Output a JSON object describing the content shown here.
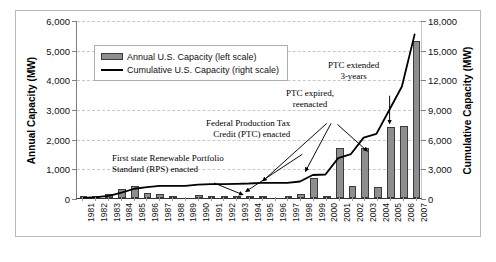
{
  "chart_data": {
    "type": "bar",
    "title": "",
    "xlabel": "",
    "ylabel": "Annual Capacity (MW)",
    "y2label": "Cumulative Capacity (MW)",
    "ylim": [
      0,
      6000
    ],
    "y2lim": [
      0,
      18000
    ],
    "grid": true,
    "legend_position": "upper-left-inside",
    "categories": [
      "1981",
      "1982",
      "1983",
      "1984",
      "1985",
      "1986",
      "1987",
      "1988",
      "1989",
      "1990",
      "1991",
      "1992",
      "1993",
      "1994",
      "1995",
      "1996",
      "1997",
      "1998",
      "1999",
      "2000",
      "2001",
      "2002",
      "2003",
      "2004",
      "2005",
      "2006",
      "2007"
    ],
    "yticks": [
      "0",
      "1,000",
      "2,000",
      "3,000",
      "4,000",
      "5,000",
      "6,000"
    ],
    "y2ticks": [
      "0",
      "3,000",
      "6,000",
      "9,000",
      "12,000",
      "15,000",
      "18,000"
    ],
    "series": [
      {
        "name": "Annual U.S. Capacity (left scale)",
        "type": "bar",
        "axis": "left",
        "unit": "MW",
        "color": "#8e8e8e",
        "values": [
          10,
          80,
          130,
          320,
          400,
          170,
          120,
          10,
          0,
          110,
          60,
          5,
          30,
          30,
          60,
          0,
          5,
          140,
          660,
          50,
          1670,
          410,
          1670,
          380,
          2400,
          2420,
          5300
        ]
      },
      {
        "name": "Cumulative U.S. Capacity (right scale)",
        "type": "line",
        "axis": "right",
        "unit": "MW",
        "color": "#000000",
        "values": [
          10,
          90,
          220,
          540,
          940,
          1110,
          1230,
          1240,
          1240,
          1350,
          1410,
          1415,
          1445,
          1475,
          1535,
          1535,
          1540,
          1680,
          2340,
          2390,
          4060,
          4470,
          6140,
          6520,
          8920,
          11340,
          16640
        ]
      }
    ],
    "legend": [
      {
        "label": "Annual U.S. Capacity (left scale)",
        "marker": "bar-swatch"
      },
      {
        "label": "Cumulative U.S. Capacity (right scale)",
        "marker": "line-swatch"
      }
    ],
    "annotations": [
      {
        "id": "rps",
        "lines": [
          "First state Renewable Portfolio",
          "Standard (RPS) enacted"
        ],
        "points_to_year": "1999"
      },
      {
        "id": "ptc-enacted",
        "lines": [
          "Federal Production Tax",
          "Credit (PTC) enacted"
        ],
        "points_to_year": "1999"
      },
      {
        "id": "ptc-expired",
        "lines": [
          "PTC expired,",
          "reenacted"
        ],
        "points_to_year": "2000, 2002, 2004"
      },
      {
        "id": "ptc-extended",
        "lines": [
          "PTC extended",
          "3-years"
        ],
        "points_to_year": "2005"
      }
    ]
  }
}
